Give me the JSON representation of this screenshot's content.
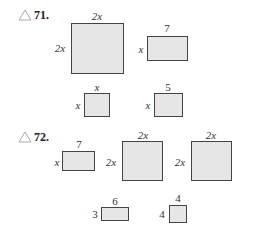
{
  "problems": [
    {
      "number": "71.",
      "icon": "triangle-icon",
      "shapes": [
        {
          "kind": "square",
          "top": "2x",
          "side": "2x"
        },
        {
          "kind": "rectangle",
          "top": "7",
          "side": "x"
        },
        {
          "kind": "square",
          "top": "x",
          "side": "x"
        },
        {
          "kind": "rectangle",
          "top": "5",
          "side": "x"
        }
      ]
    },
    {
      "number": "72.",
      "icon": "triangle-icon",
      "shapes": [
        {
          "kind": "rectangle",
          "top": "7",
          "side": "x"
        },
        {
          "kind": "square",
          "top": "2x",
          "side": "2x"
        },
        {
          "kind": "square",
          "top": "2x",
          "side": "2x"
        },
        {
          "kind": "rectangle",
          "top": "6",
          "side": "3"
        },
        {
          "kind": "square",
          "top": "4",
          "side": "4"
        }
      ]
    }
  ],
  "colors": {
    "fill": "#e6e6e6",
    "stroke": "#444444",
    "triangle": "#aaaaaa"
  }
}
